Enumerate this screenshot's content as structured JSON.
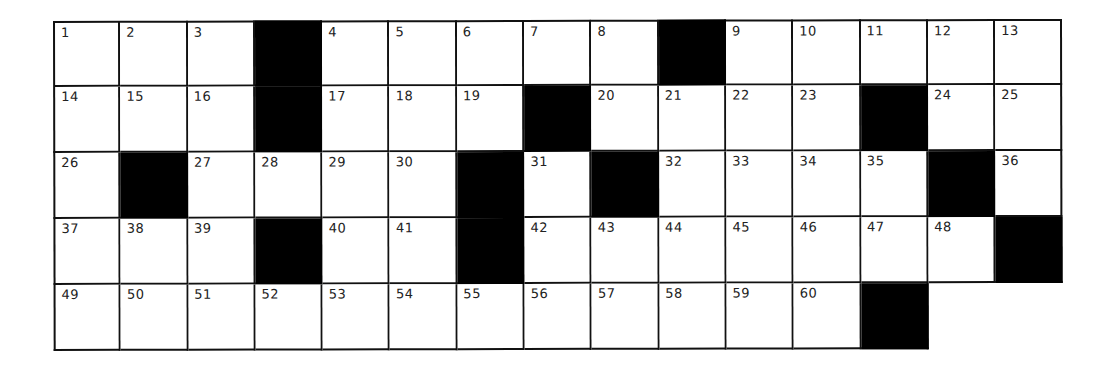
{
  "puzzle": {
    "rows": 5,
    "cols": 15,
    "colors": {
      "block": "#000000",
      "cell": "#ffffff",
      "line": "#111111",
      "number": "#222222"
    },
    "grid": [
      [
        {
          "n": "1"
        },
        {
          "n": "2"
        },
        {
          "n": "3"
        },
        {
          "b": true
        },
        {
          "n": "4"
        },
        {
          "n": "5"
        },
        {
          "n": "6"
        },
        {
          "n": "7"
        },
        {
          "n": "8"
        },
        {
          "b": true
        },
        {
          "n": "9"
        },
        {
          "n": "10"
        },
        {
          "n": "11"
        },
        {
          "n": "12"
        },
        {
          "n": "13"
        }
      ],
      [
        {
          "n": "14"
        },
        {
          "n": "15"
        },
        {
          "n": "16"
        },
        {
          "b": true
        },
        {
          "n": "17"
        },
        {
          "n": "18"
        },
        {
          "n": "19"
        },
        {
          "b": true
        },
        {
          "n": "20"
        },
        {
          "n": "21"
        },
        {
          "n": "22"
        },
        {
          "n": "23"
        },
        {
          "b": true
        },
        {
          "n": "24"
        },
        {
          "n": "25"
        }
      ],
      [
        {
          "n": "26"
        },
        {
          "b": true
        },
        {
          "n": "27"
        },
        {
          "n": "28"
        },
        {
          "n": "29"
        },
        {
          "n": "30"
        },
        {
          "b": true
        },
        {
          "n": "31"
        },
        {
          "b": true
        },
        {
          "n": "32"
        },
        {
          "n": "33"
        },
        {
          "n": "34"
        },
        {
          "n": "35"
        },
        {
          "b": true
        },
        {
          "n": "36"
        }
      ],
      [
        {
          "n": "37"
        },
        {
          "n": "38"
        },
        {
          "n": "39"
        },
        {
          "b": true
        },
        {
          "n": "40"
        },
        {
          "n": "41"
        },
        {
          "b": true
        },
        {
          "n": "42"
        },
        {
          "n": "43"
        },
        {
          "n": "44"
        },
        {
          "n": "45"
        },
        {
          "n": "46"
        },
        {
          "n": "47"
        },
        {
          "n": "48"
        },
        {
          "b": true
        }
      ],
      [
        {
          "n": "49"
        },
        {
          "n": "50"
        },
        {
          "n": "51"
        },
        {
          "n": "52"
        },
        {
          "n": "53"
        },
        {
          "n": "54"
        },
        {
          "n": "55"
        },
        {
          "n": "56"
        },
        {
          "n": "57"
        },
        {
          "n": "58"
        },
        {
          "n": "59"
        },
        {
          "n": "60"
        },
        {
          "b": true
        },
        {
          "e": true
        },
        {
          "e": true
        }
      ]
    ],
    "entries": {}
  }
}
